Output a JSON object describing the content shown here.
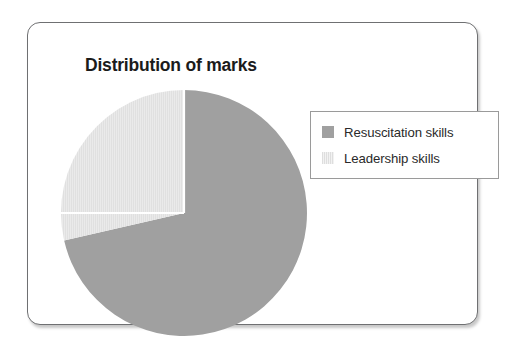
{
  "card": {
    "title": "Distribution of marks"
  },
  "legend": {
    "items": [
      {
        "label": "Resuscitation skills",
        "swatch": "solid-gray-swatch-icon",
        "color": "#a0a0a0"
      },
      {
        "label": "Leadership skills",
        "swatch": "striped-light-swatch-icon",
        "color": "#e4e4e4"
      }
    ]
  },
  "chart_data": {
    "type": "pie",
    "title": "Distribution of marks",
    "labels": [
      "Resuscitation skills",
      "Leadership skills"
    ],
    "values": [
      71.4,
      28.6
    ],
    "colors": [
      "#a0a0a0",
      "#e4e4e4"
    ],
    "start_angle_deg": 0,
    "direction": "clockwise",
    "separator_color": "#ffffff",
    "legend_position": "right",
    "grid": false,
    "xlabel": "",
    "ylabel": ""
  }
}
